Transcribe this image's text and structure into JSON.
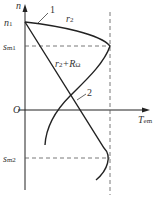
{
  "axes": {
    "y_label": "n",
    "x_label_main": "T",
    "x_label_sub": "em",
    "origin_label": "O"
  },
  "markers": {
    "n1_main": "n",
    "n1_sub": "1",
    "sm1_main": "s",
    "sm1_sub": "m1",
    "sm2_main": "s",
    "sm2_sub": "m2"
  },
  "curves": [
    {
      "id": "1",
      "label": "r",
      "label_sub": "2",
      "number": "1"
    },
    {
      "id": "2",
      "label": "r",
      "label_sub": "2",
      "label_suffix": "+R",
      "label_suffix_sub": "Ω",
      "number": "2"
    }
  ],
  "colors": {
    "line": "#222222",
    "dash": "#555555",
    "text": "#333333"
  }
}
